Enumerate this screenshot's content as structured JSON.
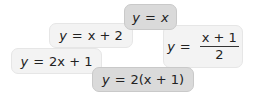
{
  "cards": [
    {
      "id": "card-1",
      "lhs": "y",
      "eq": "=",
      "rhs": "x",
      "style": "dark"
    },
    {
      "id": "card-2",
      "lhs": "y",
      "eq": "=",
      "rhs": "x + 2",
      "style": "light"
    },
    {
      "id": "card-3",
      "lhs": "y",
      "eq": "=",
      "numerator": "x + 1",
      "denominator": "2",
      "style": "light"
    },
    {
      "id": "card-4",
      "lhs": "y",
      "eq": "=",
      "rhs": "2x + 1",
      "style": "light"
    },
    {
      "id": "card-5",
      "lhs": "y",
      "eq": "=",
      "rhs": "2(x + 1)",
      "style": "dark"
    }
  ],
  "colors": {
    "light_fill": "#f3f3f3",
    "dark_fill": "#dadada",
    "text": "#222222"
  }
}
